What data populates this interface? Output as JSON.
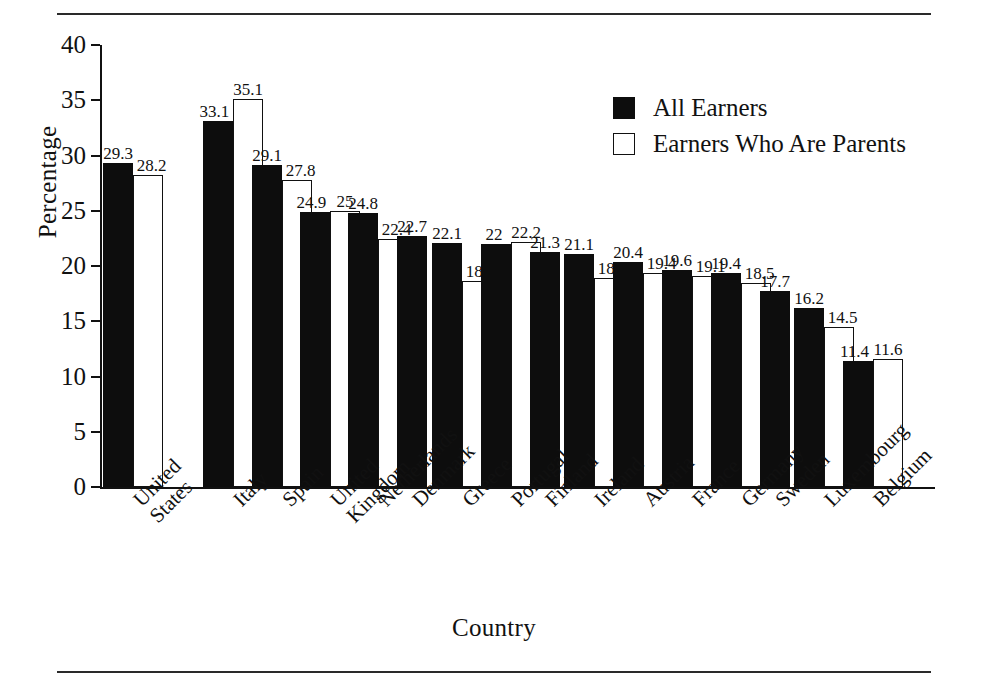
{
  "chart_data": {
    "type": "bar",
    "title": "",
    "xlabel": "Country",
    "ylabel": "Percentage",
    "ylim": [
      0,
      40
    ],
    "yticks": [
      0,
      5,
      10,
      15,
      20,
      25,
      30,
      35,
      40
    ],
    "grid": false,
    "legend_position": "top-right",
    "categories": [
      "United States",
      "Italy",
      "Spain",
      "United Kingdom",
      "Netherlands",
      "Denmark",
      "Greece",
      "Portugal",
      "Finland",
      "Ireland",
      "Austria",
      "France",
      "Germany",
      "Sweden",
      "Luxembourg",
      "Belgium"
    ],
    "category_lines": [
      [
        "United",
        "States"
      ],
      [
        "Italy"
      ],
      [
        "Spain"
      ],
      [
        "United",
        "Kingdom"
      ],
      [
        "Netherlands"
      ],
      [
        "Denmark"
      ],
      [
        "Greece"
      ],
      [
        "Portugal"
      ],
      [
        "Finland"
      ],
      [
        "Ireland"
      ],
      [
        "Austria"
      ],
      [
        "France"
      ],
      [
        "Germany"
      ],
      [
        "Sweden"
      ],
      [
        "Luxembourg"
      ],
      [
        "Belgium"
      ]
    ],
    "series": [
      {
        "name": "All Earners",
        "color": "#0d0d0d",
        "style": "filled",
        "values": [
          29.3,
          33.1,
          29.1,
          24.9,
          24.8,
          22.7,
          22.1,
          22,
          21.3,
          21.1,
          20.4,
          19.6,
          19.4,
          17.7,
          16.2,
          11.4
        ],
        "labels": [
          "29.3",
          "33.1",
          "29.1",
          "24.9",
          "24.8",
          "22.7",
          "22.1",
          "22",
          "21.3",
          "21.1",
          "20.4",
          "19.6",
          "19.4",
          "17.7",
          "16.2",
          "11.4"
        ]
      },
      {
        "name": "Earners Who Are Parents",
        "color": "#ffffff",
        "style": "hollow",
        "values": [
          28.2,
          35.1,
          27.8,
          25,
          22.4,
          null,
          18.6,
          22.2,
          null,
          18.9,
          19.4,
          19.1,
          18.5,
          null,
          14.5,
          11.6
        ],
        "labels": [
          "28.2",
          "35.1",
          "27.8",
          "25",
          "22.4",
          "",
          "18.6",
          "22.2",
          "",
          "18.9",
          "19.4",
          "19.1",
          "18.5",
          "",
          "14.5",
          "11.6"
        ]
      }
    ]
  },
  "legend": {
    "items": [
      {
        "label": "All Earners",
        "style": "filled"
      },
      {
        "label": "Earners Who Are Parents",
        "style": "hollow"
      }
    ]
  },
  "axes": {
    "y_title": "Percentage",
    "x_title": "Country",
    "y_tick_labels": [
      "40",
      "35",
      "30",
      "25",
      "20",
      "15",
      "10",
      "5",
      "0"
    ]
  }
}
